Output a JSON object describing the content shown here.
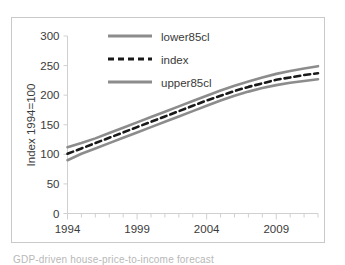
{
  "figure": {
    "caption_partial": "GDP-driven house-price-to-income forecast",
    "background_color": "#ffffff",
    "frame_color": "#c9c9c9"
  },
  "chart_data": {
    "type": "line",
    "title": "",
    "xlabel": "",
    "ylabel": "Index 1994=100",
    "xlim": [
      1994,
      2012
    ],
    "ylim": [
      0,
      300
    ],
    "yticks": [
      0,
      50,
      100,
      150,
      200,
      250,
      300
    ],
    "ytick_labels": [
      "0",
      "50",
      "100",
      "150",
      "200",
      "250",
      "300"
    ],
    "xticks": [
      1994,
      1999,
      2004,
      2009
    ],
    "xtick_labels": [
      "1994",
      "1999",
      "2004",
      "2009"
    ],
    "x_minor_tick_interval": 1,
    "grid": false,
    "legend_position": "top-center",
    "x": [
      1994,
      1995,
      1996,
      1997,
      1998,
      1999,
      2000,
      2001,
      2002,
      2003,
      2004,
      2005,
      2006,
      2007,
      2008,
      2009,
      2010,
      2011,
      2012
    ],
    "series": [
      {
        "name": "lower85cl",
        "color": "#8c8c8c",
        "style": "solid",
        "width": 2.6,
        "values": [
          90,
          101,
          110,
          119,
          128,
          137,
          146,
          155,
          164,
          173,
          182,
          191,
          199,
          206,
          212,
          217,
          221,
          224,
          227
        ]
      },
      {
        "name": "index",
        "color": "#1a1a1a",
        "style": "dashed",
        "width": 2.6,
        "values": [
          101,
          110,
          119,
          128,
          137,
          146,
          155,
          164,
          173,
          182,
          191,
          199,
          207,
          214,
          220,
          226,
          230,
          234,
          237
        ]
      },
      {
        "name": "upper85cl",
        "color": "#8c8c8c",
        "style": "solid",
        "width": 2.6,
        "values": [
          112,
          119,
          127,
          136,
          145,
          154,
          163,
          172,
          181,
          190,
          199,
          208,
          216,
          223,
          230,
          236,
          241,
          245,
          249
        ]
      }
    ],
    "legend": [
      {
        "label": "lower85cl",
        "color": "#8c8c8c",
        "style": "solid"
      },
      {
        "label": "index",
        "color": "#1a1a1a",
        "style": "dashed"
      },
      {
        "label": "upper85cl",
        "color": "#8c8c8c",
        "style": "solid"
      }
    ]
  }
}
